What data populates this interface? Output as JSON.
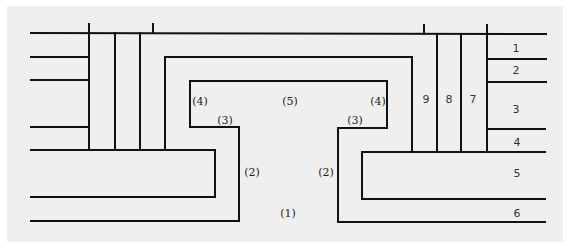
{
  "diagram": {
    "type": "cross-section layer diagram",
    "colors": {
      "background": "#efefef",
      "line": "#111111"
    },
    "region_labels": [
      {
        "id": "r1",
        "text": "(1)",
        "x": 288,
        "y": 213
      },
      {
        "id": "r2-left",
        "text": "(2)",
        "x": 252,
        "y": 172
      },
      {
        "id": "r2-right",
        "text": "(2)",
        "x": 326,
        "y": 172
      },
      {
        "id": "r3-left",
        "text": "(3)",
        "x": 225,
        "y": 120
      },
      {
        "id": "r3-right",
        "text": "(3)",
        "x": 355,
        "y": 120
      },
      {
        "id": "r4-left",
        "text": "(4)",
        "x": 200,
        "y": 101
      },
      {
        "id": "r4-right",
        "text": "(4)",
        "x": 378,
        "y": 101
      },
      {
        "id": "r5",
        "text": "(5)",
        "x": 290,
        "y": 101
      }
    ],
    "layer_numbers": [
      {
        "id": "n1",
        "text": "1",
        "x": 516,
        "y": 48
      },
      {
        "id": "n2",
        "text": "2",
        "x": 516,
        "y": 70
      },
      {
        "id": "n3",
        "text": "3",
        "x": 516,
        "y": 109
      },
      {
        "id": "n4",
        "text": "4",
        "x": 517,
        "y": 142
      },
      {
        "id": "n5",
        "text": "5",
        "x": 517,
        "y": 173
      },
      {
        "id": "n6",
        "text": "6",
        "x": 517,
        "y": 213
      },
      {
        "id": "n7",
        "text": "7",
        "x": 473,
        "y": 99
      },
      {
        "id": "n8",
        "text": "8",
        "x": 449,
        "y": 99
      },
      {
        "id": "n9",
        "text": "9",
        "x": 426,
        "y": 99
      }
    ]
  }
}
